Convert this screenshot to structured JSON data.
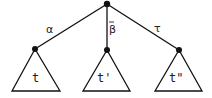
{
  "diagram": {
    "type": "tree",
    "root": {
      "id": "root"
    },
    "edges": [
      {
        "from": "root",
        "to": "left",
        "label": "α"
      },
      {
        "from": "root",
        "to": "middle",
        "label": "β",
        "overbar": true
      },
      {
        "from": "root",
        "to": "right",
        "label": "τ"
      }
    ],
    "subtrees": [
      {
        "id": "left",
        "label": "t"
      },
      {
        "id": "middle",
        "label": "t'"
      },
      {
        "id": "right",
        "label": "t\""
      }
    ]
  }
}
